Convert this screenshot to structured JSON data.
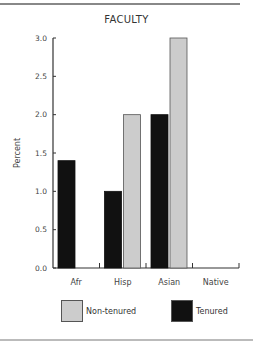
{
  "chart_data": {
    "type": "bar",
    "title": "FACULTY",
    "xlabel": "",
    "ylabel": "Percent",
    "ylim": [
      0,
      3.0
    ],
    "yticks": [
      "0.0",
      "0.5",
      "1.0",
      "1.5",
      "2.0",
      "2.5",
      "3.0"
    ],
    "categories": [
      "Afr",
      "Hisp",
      "Asian",
      "Native"
    ],
    "series": [
      {
        "name": "Tenured",
        "color": "#111111",
        "values": [
          1.4,
          1.0,
          2.0,
          0.0
        ]
      },
      {
        "name": "Non-tenured",
        "color": "#cccccc",
        "values": [
          0.0,
          2.0,
          3.0,
          0.0
        ]
      }
    ],
    "grid": false,
    "legend_position": "bottom"
  },
  "legend": {
    "items": [
      {
        "label": "Non-tenured",
        "color": "#cccccc"
      },
      {
        "label": "Tenured",
        "color": "#111111"
      }
    ]
  }
}
